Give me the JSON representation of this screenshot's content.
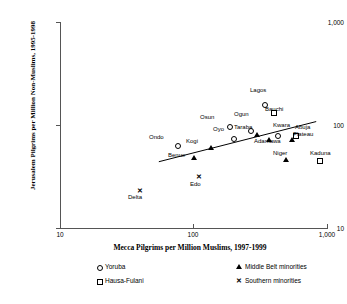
{
  "chart_data": {
    "type": "scatter",
    "title": "",
    "xlabel": "Mecca Pilgrims per Million Muslims, 1997-1999",
    "ylabel": "Jerusalem Pilgrims per Million Non-Muslims, 1995-1998",
    "xscale": "log",
    "yscale": "log",
    "xlim": [
      10,
      1000
    ],
    "ylim": [
      10,
      1000
    ],
    "xticks": [
      "10",
      "100",
      "1,000"
    ],
    "yticks": [
      "10",
      "100",
      "1,000"
    ],
    "grid": false,
    "trendline": {
      "x0": 55,
      "y0": 44,
      "x1": 830,
      "y1": 108
    },
    "points": [
      {
        "label": "Lagos",
        "group": "Yoruba",
        "marker": "circle",
        "x": 340,
        "y": 160,
        "lx": 250,
        "ly": 87,
        "align": "left"
      },
      {
        "label": "Bauchi",
        "group": "Hausa-Fulani",
        "marker": "square",
        "x": 395,
        "y": 133,
        "lx": 265,
        "ly": 106,
        "align": "left"
      },
      {
        "label": "Osun",
        "group": "Yoruba",
        "marker": "circle",
        "x": 185,
        "y": 98,
        "lx": 200,
        "ly": 114,
        "align": "left"
      },
      {
        "label": "Ogun",
        "group": "Yoruba",
        "marker": "circle",
        "x": 265,
        "y": 90,
        "lx": 234,
        "ly": 111,
        "align": "left"
      },
      {
        "label": "Oyo",
        "group": "Yoruba",
        "marker": "circle",
        "x": 198,
        "y": 74,
        "lx": 213,
        "ly": 126,
        "align": "left"
      },
      {
        "label": "Taraba",
        "group": "Middle Belt minorities",
        "marker": "tri",
        "x": 300,
        "y": 80,
        "lx": 234,
        "ly": 124,
        "align": "left"
      },
      {
        "label": "Kwara",
        "group": "Yoruba",
        "marker": "circle",
        "x": 425,
        "y": 80,
        "lx": 273,
        "ly": 122,
        "align": "left"
      },
      {
        "label": "Abuja",
        "group": "Hausa-Fulani",
        "marker": "square",
        "x": 575,
        "y": 80,
        "lx": 295,
        "ly": 124,
        "align": "left"
      },
      {
        "label": "Plateau",
        "group": "Middle Belt minorities",
        "marker": "tri",
        "x": 545,
        "y": 72,
        "lx": 293,
        "ly": 131,
        "align": "left"
      },
      {
        "label": "Adamawa",
        "group": "Middle Belt minorities",
        "marker": "tri",
        "x": 370,
        "y": 72,
        "lx": 254,
        "ly": 138,
        "align": "left"
      },
      {
        "label": "Ondo",
        "group": "Yoruba",
        "marker": "circle",
        "x": 75,
        "y": 64,
        "lx": 149,
        "ly": 134,
        "align": "left"
      },
      {
        "label": "Kogi",
        "group": "Middle Belt minorities",
        "marker": "tri",
        "x": 135,
        "y": 60,
        "lx": 186,
        "ly": 138,
        "align": "left"
      },
      {
        "label": "Benue",
        "group": "Middle Belt minorities",
        "marker": "tri",
        "x": 100,
        "y": 48,
        "lx": 168,
        "ly": 152,
        "align": "left"
      },
      {
        "label": "Niger",
        "group": "Middle Belt minorities",
        "marker": "tri",
        "x": 490,
        "y": 46,
        "lx": 273,
        "ly": 150,
        "align": "left"
      },
      {
        "label": "Kaduna",
        "group": "Hausa-Fulani",
        "marker": "square",
        "x": 870,
        "y": 46,
        "lx": 310,
        "ly": 150,
        "align": "left"
      },
      {
        "label": "Edo",
        "group": "Southern minorities",
        "marker": "x",
        "x": 110,
        "y": 31,
        "lx": 190,
        "ly": 181,
        "align": "left"
      },
      {
        "label": "Delta",
        "group": "Southern minorities",
        "marker": "x",
        "x": 40,
        "y": 23,
        "lx": 128,
        "ly": 194,
        "align": "left"
      }
    ],
    "legend": {
      "position": "below",
      "entries": [
        {
          "label": "Yoruba",
          "marker": "circle"
        },
        {
          "label": "Middle Belt minorities",
          "marker": "tri"
        },
        {
          "label": "Hausa-Fulani",
          "marker": "square"
        },
        {
          "label": "Southern minorities",
          "marker": "x"
        }
      ]
    }
  },
  "axes": {
    "y_title": "Jerusalem Pilgrims per Million Non-Muslims, 1995-1998",
    "x_title": "Mecca Pilgrims per Million Muslims, 1997-1999",
    "y_ticks": [
      {
        "label": "1,000",
        "top": 22
      },
      {
        "label": "100",
        "top": 125
      },
      {
        "label": "10",
        "top": 228
      }
    ],
    "x_ticks": [
      {
        "label": "10",
        "left": 60
      },
      {
        "label": "100",
        "left": 193
      },
      {
        "label": "1,000",
        "left": 327
      }
    ]
  },
  "colors": {
    "axis": "#555555",
    "marker": "#000000",
    "background": "#ffffff"
  }
}
